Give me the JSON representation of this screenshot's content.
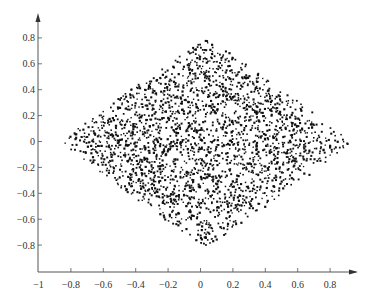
{
  "chart_data": {
    "type": "scatter",
    "title": "",
    "xlabel": "",
    "ylabel": "",
    "xlim": [
      -1,
      0.95
    ],
    "ylim": [
      -0.95,
      0.95
    ],
    "grid": false,
    "legend": null,
    "x_ticks": [
      -1,
      -0.8,
      -0.6,
      -0.4,
      -0.2,
      0,
      0.2,
      0.4,
      0.6,
      0.8
    ],
    "x_tick_labels": [
      "−1",
      "−0.8",
      "−0.6",
      "−0.4",
      "−0.2",
      "0",
      "0.2",
      "0.4",
      "0.6",
      "0.8"
    ],
    "y_ticks": [
      0.8,
      0.6,
      0.4,
      0.2,
      0,
      -0.2,
      -0.4,
      -0.6,
      -0.8
    ],
    "y_tick_labels": [
      "0.8",
      "0.6",
      "0.4",
      "0.2",
      "0",
      "−0.2",
      "−0.4",
      "−0.6",
      "−0.8"
    ],
    "point_cloud": {
      "description": "approx. 2500 uniformly scattered points filling a diamond/rhombus-shaped region",
      "shape": "diamond",
      "x_extent": [
        -0.87,
        0.93
      ],
      "y_extent": [
        -0.8,
        0.8
      ],
      "center": [
        0.0,
        0.0
      ],
      "approx_count": 2500,
      "marker_color": "#111111",
      "marker_size_px": 1.6
    },
    "axis_color": "#555555",
    "axes_style": "arrowed axes (x-axis arrow to right, y-axis arrow up), origin at bottom-left (-1, -0.95)"
  }
}
